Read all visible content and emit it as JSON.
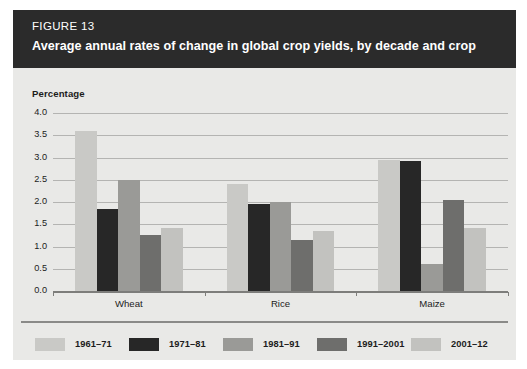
{
  "figure": {
    "number_label": "FIGURE 13",
    "title": "Average annual rates of change in global crop yields, by decade and crop"
  },
  "chart_data": {
    "type": "bar",
    "title": "Average annual rates of change in global crop yields, by decade and crop",
    "subtitle": "FIGURE 13",
    "xlabel": "",
    "ylabel": "Percentage",
    "ylim": [
      0.0,
      4.0
    ],
    "ytick_labels": [
      "0.0",
      "0.5",
      "1.0",
      "1.5",
      "2.0",
      "2.5",
      "3.0",
      "3.5",
      "4.0"
    ],
    "ytick_values": [
      0.0,
      0.5,
      1.0,
      1.5,
      2.0,
      2.5,
      3.0,
      3.5,
      4.0
    ],
    "grid": true,
    "legend_position": "bottom",
    "categories": [
      "Wheat",
      "Rice",
      "Maize"
    ],
    "series": [
      {
        "name": "1961–71",
        "color": "#c9c9c6",
        "values": [
          3.6,
          2.4,
          2.95
        ]
      },
      {
        "name": "1971–81",
        "color": "#272727",
        "values": [
          1.85,
          1.95,
          2.92
        ]
      },
      {
        "name": "1981–91",
        "color": "#9a9a97",
        "values": [
          2.5,
          2.0,
          0.61
        ]
      },
      {
        "name": "1991–2001",
        "color": "#6e6e6c",
        "values": [
          1.27,
          1.15,
          2.05
        ]
      },
      {
        "name": "2001–12",
        "color": "#c2c2bf",
        "values": [
          1.42,
          1.35,
          1.42
        ]
      }
    ]
  },
  "colors": {
    "header_band": "#2b2b2b",
    "panel_background": "#e9e9e7",
    "gridline": "#b4b4b2",
    "axis": "#7d7d7b",
    "text": "#1c1c1c"
  }
}
